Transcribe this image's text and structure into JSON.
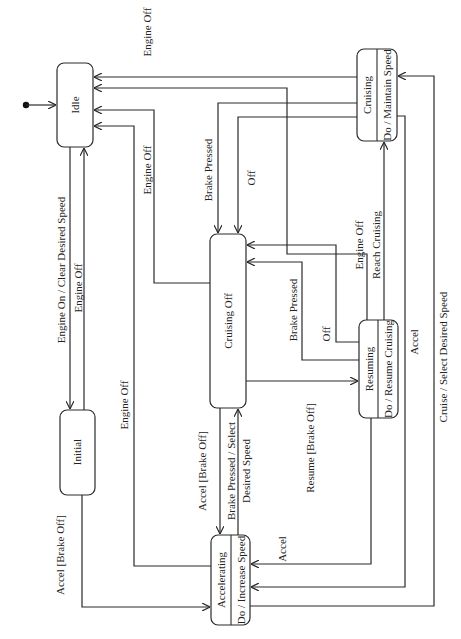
{
  "diagram": {
    "type": "state-machine",
    "orientation": "rotated-90-ccw",
    "states": [
      {
        "id": "idle",
        "name": "Idle",
        "activity": ""
      },
      {
        "id": "initial",
        "name": "Initial",
        "activity": ""
      },
      {
        "id": "cruising_off",
        "name": "Cruising Off",
        "activity": ""
      },
      {
        "id": "accelerating",
        "name": "Accelerating",
        "activity": "Do / Increase Speed"
      },
      {
        "id": "resuming",
        "name": "Resuming",
        "activity": "Do / Resume Cruising"
      },
      {
        "id": "cruising",
        "name": "Cruising",
        "activity": "Do / Maintain Speed"
      }
    ],
    "transitions": [
      {
        "from": "start",
        "to": "idle",
        "label": ""
      },
      {
        "from": "idle",
        "to": "initial",
        "label": "Engine On / Clear Desired Speed"
      },
      {
        "from": "initial",
        "to": "idle",
        "label": "Engine Off"
      },
      {
        "from": "initial",
        "to": "accelerating",
        "label": "Accel [Brake Off]"
      },
      {
        "from": "accelerating",
        "to": "idle",
        "label": "Engine Off"
      },
      {
        "from": "cruising_off",
        "to": "idle",
        "label": "Engine Off"
      },
      {
        "from": "resuming",
        "to": "idle",
        "label": "Engine Off"
      },
      {
        "from": "cruising",
        "to": "idle",
        "label": "Engine Off"
      },
      {
        "from": "cruising",
        "to": "cruising_off",
        "label": "Brake Pressed"
      },
      {
        "from": "cruising",
        "to": "cruising_off",
        "label": "Off"
      },
      {
        "from": "resuming",
        "to": "cruising_off",
        "label": "Off"
      },
      {
        "from": "resuming",
        "to": "cruising_off",
        "label": "Brake Pressed"
      },
      {
        "from": "cruising_off",
        "to": "resuming",
        "label": "Resume [Brake Off]"
      },
      {
        "from": "resuming",
        "to": "cruising",
        "label": "Reach Cruising"
      },
      {
        "from": "cruising_off",
        "to": "accelerating",
        "label": "Accel [Brake Off]"
      },
      {
        "from": "accelerating",
        "to": "cruising_off",
        "label": "Brake Pressed / Select Desired Speed"
      },
      {
        "from": "resuming",
        "to": "accelerating",
        "label": "Accel"
      },
      {
        "from": "cruising",
        "to": "accelerating",
        "label": "Accel"
      },
      {
        "from": "accelerating",
        "to": "cruising",
        "label": "Cruise / Select Desired Speed"
      }
    ]
  },
  "labels": {
    "idle": "Idle",
    "initial": "Initial",
    "cruising_off": "Cruising Off",
    "accelerating": "Accelerating",
    "accelerating_do": "Do / Increase Speed",
    "resuming": "Resuming",
    "resuming_do": "Do / Resume Cruising",
    "cruising": "Cruising",
    "cruising_do": "Do / Maintain Speed",
    "t_engine_on": "Engine On / Clear Desired Speed",
    "t_initial_engine_off": "Engine Off",
    "t_initial_accel": "Accel [Brake Off]",
    "t_accel_engine_off": "Engine Off",
    "t_cruisingoff_engine_off": "Engine Off",
    "t_cruising_engine_off": "Engine Off",
    "t_cruising_brake": "Brake Pressed",
    "t_cruising_off": "Off",
    "t_resuming_off": "Off",
    "t_resuming_brake": "Brake Pressed",
    "t_resume": "Resume [Brake Off]",
    "t_resuming_engine_off": "Engine Off",
    "t_reach_cruising": "Reach Cruising",
    "t_cruisingoff_accel": "Accel [Brake Off]",
    "t_brake_select_1": "Brake Pressed / Select",
    "t_brake_select_2": "Desired Speed",
    "t_resuming_accel": "Accel",
    "t_cruising_accel": "Accel",
    "t_cruise_select": "Cruise / Select Desired Speed"
  }
}
